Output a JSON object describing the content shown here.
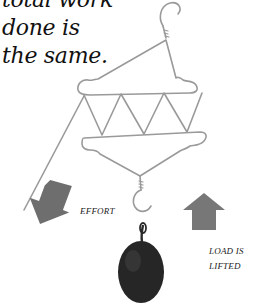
{
  "caption": {
    "lines": [
      "total work",
      "done is",
      "the same."
    ]
  },
  "labels": {
    "effort": "EFFORT",
    "load_line1": "LOAD IS",
    "load_line2": "LIFTED"
  },
  "icons": {
    "effort_arrow": "arrow-down-left",
    "load_arrow": "arrow-up",
    "weight": "round-weight",
    "hanger": "coat-hanger-assembly"
  },
  "colors": {
    "wire": "#9a9a9a",
    "arrow": "#6e6e6e",
    "weight": "#2a2a2a",
    "text": "#111111"
  }
}
